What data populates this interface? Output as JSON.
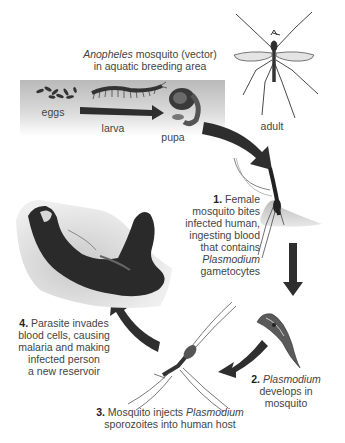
{
  "title": {
    "species": "Anopheles",
    "line1_rest": " mosquito (vector)",
    "line2": "in aquatic breeding area"
  },
  "stages": {
    "eggs": "eggs",
    "larva": "larva",
    "pupa": "pupa",
    "adult": "adult"
  },
  "steps": [
    {
      "number": "1.",
      "lines": [
        "Female",
        "mosquito bites",
        "infected human,",
        "ingesting blood",
        "that contains"
      ],
      "italic": "Plasmodium",
      "tail": "gametocytes"
    },
    {
      "number": "2.",
      "italic": "Plasmodium",
      "lines": [
        "develops in",
        "mosquito"
      ]
    },
    {
      "number": "3.",
      "pre": " Mosquito injects ",
      "italic": "Plasmodium",
      "line2": "sporozoites into human host"
    },
    {
      "number": "4.",
      "line1": " Parasite invades",
      "lines": [
        "blood cells, causing",
        "malaria and making",
        "infected person",
        "a new reservoir"
      ]
    }
  ],
  "colors": {
    "arrow": "#2e2e2e",
    "water_band": "#c8c8c8",
    "text": "#444444"
  }
}
